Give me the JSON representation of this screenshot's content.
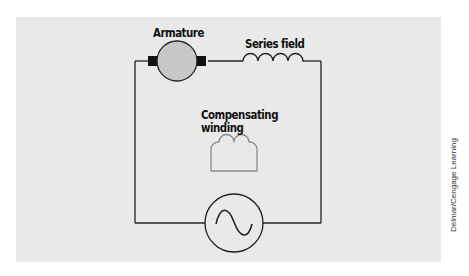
{
  "diagram": {
    "labels": {
      "armature": "Armature",
      "series_field": "Series field",
      "compensating_line1": "Compensating",
      "compensating_line2": "winding"
    },
    "components": [
      {
        "id": "armature",
        "type": "armature-with-brushes",
        "label": "Armature"
      },
      {
        "id": "series_field",
        "type": "inductor-coil",
        "turns": 4,
        "label": "Series field"
      },
      {
        "id": "compensating_winding",
        "type": "inductor-coil",
        "turns": 3,
        "label": "Compensating winding",
        "connected": false
      },
      {
        "id": "ac_source",
        "type": "ac-voltage-source",
        "symbol": "sine-wave"
      }
    ],
    "colors": {
      "background": "#e9e9e9",
      "armature_fill": "#c8c8c8",
      "wire": "#222222",
      "compensating_winding": "#8a8a8a"
    }
  },
  "credit": "Delmar/Cengage Learning"
}
